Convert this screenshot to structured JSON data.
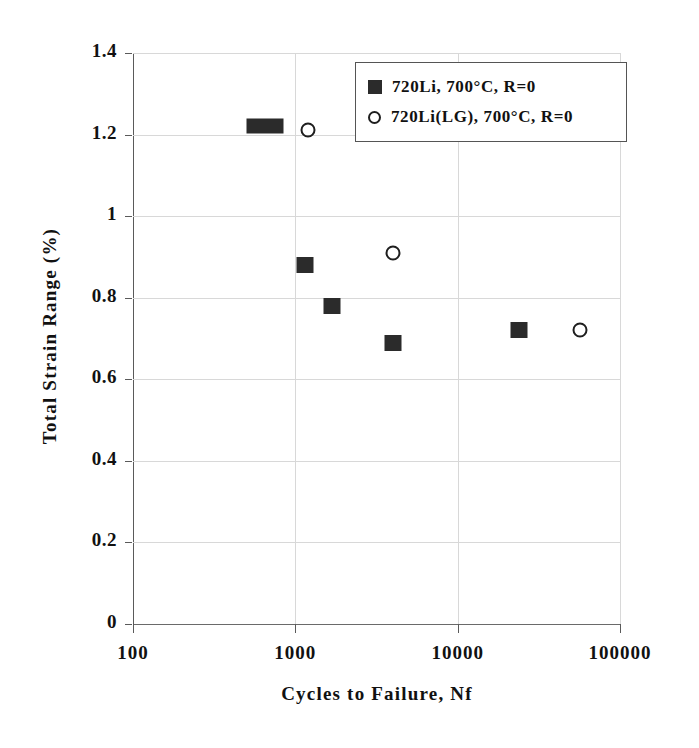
{
  "chart_data": {
    "type": "scatter",
    "title": "",
    "xlabel": "Cycles to Failure, Nf",
    "ylabel": "Total Strain Range (%)",
    "xscale": "log",
    "yscale": "linear",
    "xlim": [
      100,
      100000
    ],
    "ylim": [
      0,
      1.4
    ],
    "grid": true,
    "legend_position": "top-right",
    "xticks": [
      100,
      1000,
      10000,
      100000
    ],
    "xtick_labels": [
      "100",
      "1000",
      "10000",
      "100000"
    ],
    "yticks": [
      0,
      0.2,
      0.4,
      0.6,
      0.8,
      1,
      1.2,
      1.4
    ],
    "ytick_labels": [
      "0",
      "0.2",
      "0.4",
      "0.6",
      "0.8",
      "1",
      "1.2",
      "1.4"
    ],
    "series": [
      {
        "name": "720Li, 700°C, R=0",
        "marker": "filled-square",
        "color": "#2b2b2b",
        "points": [
          {
            "x": 650,
            "y": 1.22,
            "wide": true
          },
          {
            "x": 1150,
            "y": 0.88,
            "wide": false
          },
          {
            "x": 1680,
            "y": 0.78,
            "wide": false
          },
          {
            "x": 4000,
            "y": 0.69,
            "wide": false
          },
          {
            "x": 24000,
            "y": 0.72,
            "wide": false
          }
        ]
      },
      {
        "name": "720Li(LG), 700°C, R=0",
        "marker": "open-circle",
        "color": "#1e1e1e",
        "points": [
          {
            "x": 1200,
            "y": 1.21
          },
          {
            "x": 4000,
            "y": 0.91
          },
          {
            "x": 57000,
            "y": 0.72
          }
        ]
      }
    ]
  },
  "legend": {
    "entries": [
      {
        "label": "720Li, 700°C, R=0",
        "marker": "filled-square"
      },
      {
        "label": "720Li(LG), 700°C, R=0",
        "marker": "open-circle"
      }
    ]
  },
  "axes": {
    "x_title": "Cycles to Failure, Nf",
    "y_title": "Total Strain Range (%)"
  }
}
